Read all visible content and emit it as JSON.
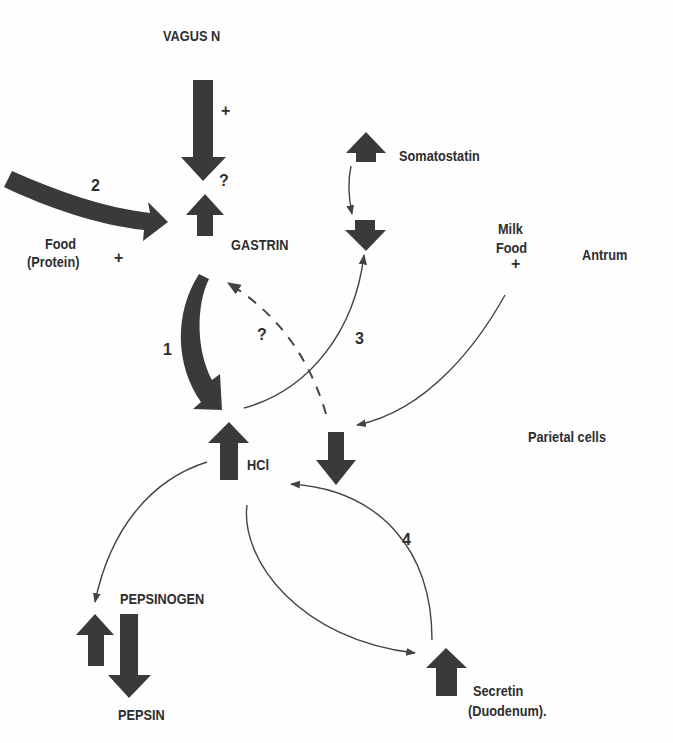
{
  "diagram": {
    "colors": {
      "arrow_fill": "#3a3a3a",
      "line": "#444444",
      "text": "#2e2e2e",
      "background": "#fefefe"
    },
    "nodes": {
      "vagus": "VAGUS N",
      "vagus_sign": "+",
      "vagus_question": "?",
      "food_line1": "Food",
      "food_line2": "(Protein)",
      "food_sign": "+",
      "gastrin": "GASTRIN",
      "somatostatin": "Somatostatin",
      "milk_line1": "Milk",
      "milk_line2": "Food",
      "milk_sign": "+",
      "antrum": "Antrum",
      "parietal": "Parietal cells",
      "hcl": "HCl",
      "pepsinogen": "PEPSINOGEN",
      "pepsin": "PEPSIN",
      "secretin_line1": "Secretin",
      "secretin_line2": "(Duodenum)."
    },
    "pathway_labels": {
      "p1": "1",
      "p2": "2",
      "p3": "3",
      "p4": "4",
      "feedback_question": "?"
    },
    "edges": [
      {
        "from": "VAGUS N",
        "to": "GASTRIN",
        "effect": "+",
        "style": "thick arrow"
      },
      {
        "from": "Food (Protein)",
        "to": "GASTRIN",
        "label": "2",
        "effect": "+",
        "style": "thick arrow"
      },
      {
        "from": "GASTRIN",
        "to": "HCl",
        "label": "1",
        "style": "thick curved arrow"
      },
      {
        "from": "HCl",
        "to": "Somatostatin (decrease)",
        "label": "3",
        "style": "thin arrow"
      },
      {
        "from": "Somatostatin",
        "to": "Somatostatin (decrease)",
        "style": "thin arrow"
      },
      {
        "from": "HCl (decrease)",
        "to": "GASTRIN",
        "label": "?",
        "style": "dashed arrow"
      },
      {
        "from": "Milk Food",
        "to": "HCl (decrease)",
        "effect": "+",
        "style": "thin arrow"
      },
      {
        "from": "HCl",
        "to": "PEPSINOGEN",
        "style": "thin arrow"
      },
      {
        "from": "HCl",
        "to": "Secretin",
        "style": "thin arrow"
      },
      {
        "from": "Secretin",
        "to": "HCl",
        "label": "4",
        "style": "thin arrow"
      }
    ]
  }
}
